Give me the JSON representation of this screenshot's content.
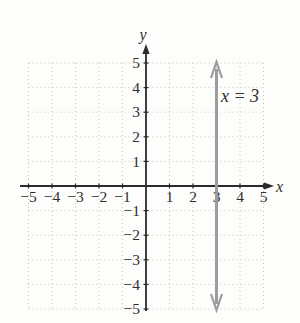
{
  "figure": {
    "equation_label": "x = 3",
    "x_axis_label": "x",
    "y_axis_label": "y"
  },
  "chart_data": {
    "type": "line",
    "title": "",
    "equation": "x = 3",
    "series": [
      {
        "name": "x = 3",
        "points": [
          [
            3,
            -5
          ],
          [
            3,
            5
          ]
        ],
        "style": "vertical-line-double-arrow",
        "color": "#9c9c9c"
      }
    ],
    "xlabel": "x",
    "ylabel": "y",
    "xlim": [
      -5,
      5
    ],
    "ylim": [
      -5,
      5
    ],
    "x_ticks": [
      -5,
      -4,
      -3,
      -2,
      -1,
      1,
      2,
      3,
      4,
      5
    ],
    "y_ticks": [
      5,
      4,
      3,
      2,
      1,
      -1,
      -2,
      -3,
      -4,
      -5
    ],
    "grid": "dotted",
    "legend": "none",
    "annotation": {
      "text": "x = 3",
      "x": 4.0,
      "y": 3.4
    },
    "colors": {
      "axis": "#2b2b2b",
      "text": "#2f2f2f",
      "grid": "#c8c4bb",
      "line": "#9c9c9c",
      "background": "#fdfdfb"
    }
  }
}
